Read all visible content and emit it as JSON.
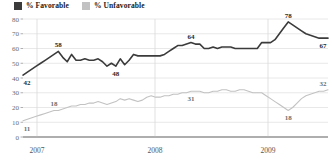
{
  "legend": {
    "items": [
      {
        "label": "% Favorable",
        "color": "#3b3b3b",
        "name": "legend-favorable"
      },
      {
        "label": "% Unfavorable",
        "color": "#c2c2c2",
        "name": "legend-unfavorable"
      }
    ]
  },
  "chart_data": {
    "type": "line",
    "title": "",
    "subtitle": "",
    "xlabel": "",
    "ylabel": "",
    "ylim": [
      0,
      80
    ],
    "yticks": [
      0,
      10,
      20,
      30,
      40,
      50,
      60,
      70,
      80
    ],
    "ytick_labels": [
      "0",
      "10",
      "20",
      "30",
      "40",
      "50",
      "60",
      "70",
      "80"
    ],
    "xticks": [
      2007,
      2008,
      2009
    ],
    "xtick_labels": [
      "2007",
      "2008",
      "2009"
    ],
    "grid": "both",
    "legend_position": "top-left",
    "series": [
      {
        "name": "% Favorable",
        "color": "#3b3b3b",
        "values": [
          42,
          44,
          46,
          48,
          50,
          52,
          54,
          56,
          58,
          54,
          51,
          56,
          52,
          52,
          53,
          52,
          52,
          53,
          51,
          48,
          50,
          48,
          53,
          49,
          52,
          56,
          55,
          55,
          55,
          55,
          55,
          55,
          56,
          58,
          60,
          62,
          62,
          63,
          64,
          63,
          63,
          60,
          60,
          61,
          60,
          61,
          61,
          61,
          60,
          60,
          60,
          60,
          60,
          60,
          64,
          64,
          64,
          66,
          70,
          74,
          78,
          76,
          74,
          72,
          70,
          69,
          68,
          67,
          67,
          67
        ],
        "labels": [
          {
            "index": 0,
            "value": 42,
            "text": "42"
          },
          {
            "index": 8,
            "value": 58,
            "text": "58"
          },
          {
            "index": 21,
            "value": 48,
            "text": "48"
          },
          {
            "index": 38,
            "value": 64,
            "text": "64"
          },
          {
            "index": 60,
            "value": 78,
            "text": "78"
          },
          {
            "index": 69,
            "value": 67,
            "text": "67"
          }
        ]
      },
      {
        "name": "% Unfavorable",
        "color": "#c2c2c2",
        "values": [
          11,
          12,
          13,
          14,
          15,
          16,
          17,
          18,
          18,
          19,
          20,
          21,
          21,
          22,
          22,
          23,
          23,
          24,
          23,
          22,
          23,
          24,
          26,
          25,
          26,
          25,
          24,
          25,
          27,
          28,
          27,
          27,
          28,
          28,
          29,
          29,
          30,
          30,
          31,
          31,
          31,
          30,
          30,
          31,
          31,
          32,
          32,
          31,
          31,
          32,
          32,
          31,
          30,
          30,
          30,
          28,
          26,
          24,
          22,
          20,
          18,
          20,
          23,
          26,
          28,
          29,
          30,
          31,
          31,
          32
        ],
        "labels": [
          {
            "index": 0,
            "value": 11,
            "text": "11"
          },
          {
            "index": 7,
            "value": 18,
            "text": "18"
          },
          {
            "index": 38,
            "value": 31,
            "text": "31"
          },
          {
            "index": 60,
            "value": 18,
            "text": "18"
          },
          {
            "index": 69,
            "value": 32,
            "text": "32"
          }
        ]
      }
    ]
  }
}
